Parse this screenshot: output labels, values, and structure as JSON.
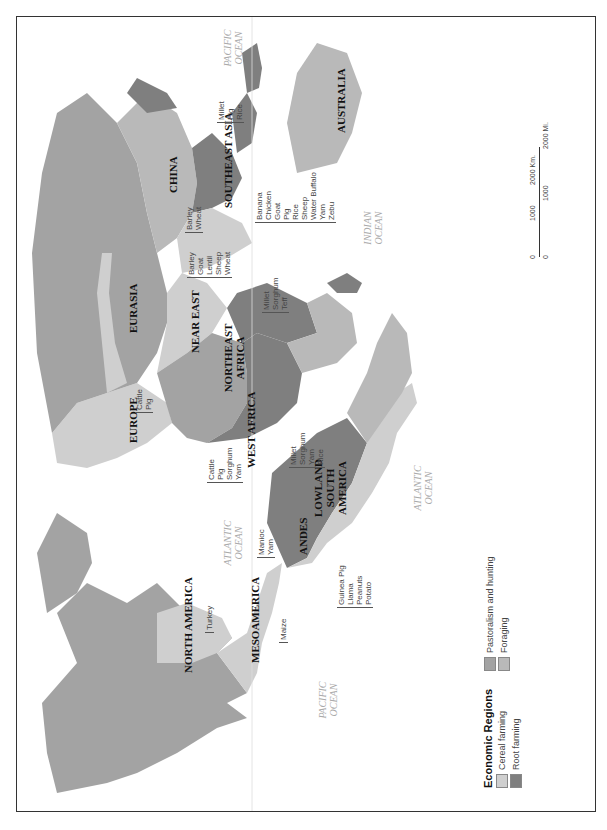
{
  "map": {
    "orientation": "rotated 90 degrees counter-clockwise",
    "colors": {
      "cereal_farming": "#cfcfcf",
      "root_farming": "#7f7f7f",
      "pastoralism_and_hunting": "#a3a3a3",
      "foraging": "#b9b9b9",
      "water": "#ffffff",
      "frame": "#333333"
    },
    "regions": {
      "north_america": "NORTH AMERICA",
      "mesoamerica": "MESOAMERICA",
      "andes": "ANDES",
      "lowland_south_america": "LOWLAND SOUTH AMERICA",
      "europe": "EUROPE",
      "eurasia": "EURASIA",
      "near_east": "NEAR EAST",
      "northeast_africa": "NORTHEAST AFRICA",
      "west_africa": "WEST AFRICA",
      "china": "CHINA",
      "southeast_asia": "SOUTHEAST ASIA",
      "australia": "AUSTRALIA"
    },
    "oceans": {
      "pacific_east": "PACIFIC OCEAN",
      "pacific_west": "PACIFIC OCEAN",
      "atlantic_north": "ATLANTIC OCEAN",
      "atlantic_south": "ATLANTIC OCEAN",
      "indian": "INDIAN OCEAN"
    },
    "crops": {
      "north_america": [
        "Turkey"
      ],
      "mesoamerica": [
        "Maize"
      ],
      "andes": [
        "Guinea Pig",
        "Llama",
        "Peanuts",
        "Potato"
      ],
      "lowland_south_america": [
        "Manioc",
        "Yam"
      ],
      "europe": [
        "Cattle",
        "Pig"
      ],
      "west_africa_north": [
        "Cattle",
        "Pig",
        "Sorghum",
        "Yam"
      ],
      "west_africa": [
        "Millet",
        "Sorghum",
        "Yam",
        "Rice"
      ],
      "northeast_africa": [
        "Millet",
        "Sorghum",
        "Teff"
      ],
      "near_east": [
        "Barley",
        "Goat",
        "Lentil",
        "Sheep",
        "Wheat"
      ],
      "eurasia": [
        "Barley",
        "Wheat"
      ],
      "southeast_asia": [
        "Banana",
        "Chicken",
        "Goat",
        "Pig",
        "Rice",
        "Sheep",
        "Water Buffalo",
        "Yam",
        "Zebu"
      ],
      "china": [
        "Millet",
        "Pig",
        "Rice"
      ]
    }
  },
  "legend": {
    "title": "Economic Regions",
    "items": [
      {
        "label": "Cereal farming"
      },
      {
        "label": "Root farming"
      },
      {
        "label": "Pastoralism and hunting"
      },
      {
        "label": "Foraging"
      }
    ]
  },
  "scale": {
    "km_ticks": [
      "0",
      "1000",
      "2000 Km."
    ],
    "mi_ticks": [
      "0",
      "1000",
      "2000 Mi."
    ]
  }
}
